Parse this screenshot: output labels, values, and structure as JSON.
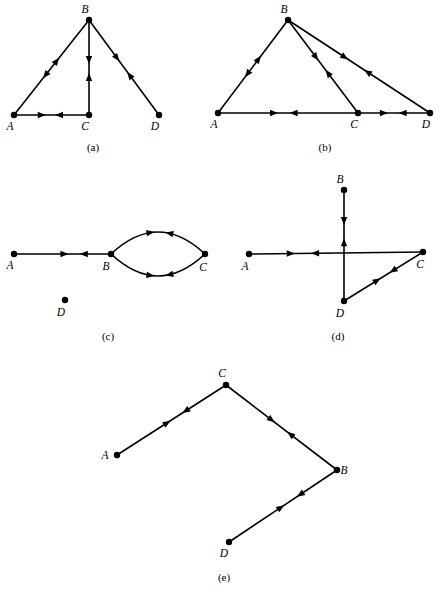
{
  "figure": {
    "width": 443,
    "height": 596,
    "background_color": "#ffffff",
    "ink_color": "#000000",
    "vertex_radius": 3.2,
    "edge_stroke_width": 1.6,
    "arrow_length": 8,
    "arrow_half_width": 3.2
  },
  "panels": [
    {
      "id": "a",
      "caption": "(a)",
      "caption_x": 93,
      "caption_y": 151,
      "vertices": [
        {
          "name": "A",
          "x": 14,
          "y": 115,
          "label": "A",
          "label_x": 10,
          "label_y": 130
        },
        {
          "name": "B",
          "x": 89,
          "y": 20,
          "label": "B",
          "label_x": 85,
          "label_y": 13
        },
        {
          "name": "C",
          "x": 89,
          "y": 115,
          "label": "C",
          "label_x": 85,
          "label_y": 130
        },
        {
          "name": "D",
          "x": 159,
          "y": 115,
          "label": "D",
          "label_x": 155,
          "label_y": 130
        }
      ],
      "edges": [
        {
          "from": "A",
          "to": "B",
          "name": "edge-a-b",
          "arrows": [
            {
              "t": 0.42,
              "dir": "backward"
            },
            {
              "t": 0.57,
              "dir": "forward"
            }
          ]
        },
        {
          "from": "B",
          "to": "C",
          "name": "edge-b-c",
          "arrows": [
            {
              "t": 0.42,
              "dir": "forward"
            },
            {
              "t": 0.6,
              "dir": "backward"
            }
          ]
        },
        {
          "from": "A",
          "to": "C",
          "name": "edge-a-c",
          "arrows": [
            {
              "t": 0.37,
              "dir": "forward"
            },
            {
              "t": 0.6,
              "dir": "backward"
            }
          ]
        },
        {
          "from": "B",
          "to": "D",
          "name": "edge-b-d",
          "arrows": [
            {
              "t": 0.4,
              "dir": "forward"
            },
            {
              "t": 0.58,
              "dir": "backward"
            }
          ]
        }
      ]
    },
    {
      "id": "b",
      "caption": "(b)",
      "caption_x": 325,
      "caption_y": 151,
      "vertices": [
        {
          "name": "A",
          "x": 218,
          "y": 113,
          "label": "A",
          "label_x": 214,
          "label_y": 128
        },
        {
          "name": "B",
          "x": 288,
          "y": 20,
          "label": "B",
          "label_x": 284,
          "label_y": 13
        },
        {
          "name": "C",
          "x": 358,
          "y": 113,
          "label": "C",
          "label_x": 354,
          "label_y": 128
        },
        {
          "name": "D",
          "x": 430,
          "y": 113,
          "label": "D",
          "label_x": 426,
          "label_y": 128
        }
      ],
      "edges": [
        {
          "from": "A",
          "to": "B",
          "name": "edge-a-b",
          "arrows": [
            {
              "t": 0.42,
              "dir": "backward"
            },
            {
              "t": 0.58,
              "dir": "forward"
            }
          ]
        },
        {
          "from": "B",
          "to": "C",
          "name": "edge-b-c",
          "arrows": [
            {
              "t": 0.4,
              "dir": "forward"
            },
            {
              "t": 0.57,
              "dir": "backward"
            }
          ]
        },
        {
          "from": "B",
          "to": "D",
          "name": "edge-b-d",
          "arrows": [
            {
              "t": 0.4,
              "dir": "forward"
            },
            {
              "t": 0.56,
              "dir": "backward"
            }
          ]
        },
        {
          "from": "A",
          "to": "C",
          "name": "edge-a-c",
          "arrows": [
            {
              "t": 0.4,
              "dir": "forward"
            },
            {
              "t": 0.54,
              "dir": "backward"
            }
          ]
        },
        {
          "from": "C",
          "to": "D",
          "name": "edge-c-d",
          "arrows": [
            {
              "t": 0.36,
              "dir": "forward"
            },
            {
              "t": 0.62,
              "dir": "backward"
            }
          ]
        }
      ]
    },
    {
      "id": "c",
      "caption": "(c)",
      "caption_x": 108,
      "caption_y": 340,
      "vertices": [
        {
          "name": "A",
          "x": 14,
          "y": 254,
          "label": "A",
          "label_x": 10,
          "label_y": 269
        },
        {
          "name": "B",
          "x": 111,
          "y": 254,
          "label": "B",
          "label_x": 106,
          "label_y": 270
        },
        {
          "name": "C",
          "x": 205,
          "y": 254,
          "label": "C",
          "label_x": 203,
          "label_y": 271
        },
        {
          "name": "D",
          "x": 65,
          "y": 300,
          "label": "D",
          "label_x": 61,
          "label_y": 316
        }
      ],
      "edges": [
        {
          "from": "A",
          "to": "B",
          "name": "edge-a-b",
          "arrows": [
            {
              "t": 0.52,
              "dir": "forward"
            },
            {
              "t": 0.72,
              "dir": "backward"
            }
          ]
        }
      ],
      "curved_edges": [
        {
          "from": "B",
          "to": "C",
          "name": "edge-b-c-upper",
          "bow": -22,
          "arrows": [
            {
              "t": 0.42,
              "dir": "forward"
            },
            {
              "t": 0.62,
              "dir": "backward"
            }
          ]
        },
        {
          "from": "B",
          "to": "C",
          "name": "edge-b-c-lower",
          "bow": 22,
          "arrows": [
            {
              "t": 0.42,
              "dir": "forward"
            },
            {
              "t": 0.62,
              "dir": "backward"
            }
          ]
        }
      ],
      "isolated_vertices": [
        "D"
      ]
    },
    {
      "id": "d",
      "caption": "(d)",
      "caption_x": 338,
      "caption_y": 340,
      "vertices": [
        {
          "name": "A",
          "x": 249,
          "y": 254,
          "label": "A",
          "label_x": 245,
          "label_y": 270
        },
        {
          "name": "B",
          "x": 344,
          "y": 190,
          "label": "B",
          "label_x": 340,
          "label_y": 183
        },
        {
          "name": "C",
          "x": 423,
          "y": 252,
          "label": "C",
          "label_x": 420,
          "label_y": 268
        },
        {
          "name": "D",
          "x": 344,
          "y": 301,
          "label": "D",
          "label_x": 340,
          "label_y": 317
        }
      ],
      "edges": [
        {
          "from": "A",
          "to": "C",
          "name": "edge-a-c",
          "arrows": [
            {
              "t": 0.24,
              "dir": "forward"
            },
            {
              "t": 0.38,
              "dir": "backward"
            }
          ]
        },
        {
          "from": "B",
          "to": "D",
          "name": "edge-b-d",
          "arrows": [
            {
              "t": 0.28,
              "dir": "forward"
            },
            {
              "t": 0.47,
              "dir": "backward"
            }
          ]
        },
        {
          "from": "D",
          "to": "C",
          "name": "edge-d-c",
          "arrows": [
            {
              "t": 0.42,
              "dir": "forward"
            },
            {
              "t": 0.62,
              "dir": "backward"
            }
          ]
        }
      ]
    },
    {
      "id": "e",
      "caption": "(e)",
      "caption_x": 224,
      "caption_y": 581,
      "vertices": [
        {
          "name": "A",
          "x": 117,
          "y": 455,
          "label": "A",
          "label_x": 105,
          "label_y": 459
        },
        {
          "name": "B",
          "x": 337,
          "y": 470,
          "label": "B",
          "label_x": 344,
          "label_y": 474
        },
        {
          "name": "C",
          "x": 226,
          "y": 385,
          "label": "C",
          "label_x": 222,
          "label_y": 377
        },
        {
          "name": "D",
          "x": 229,
          "y": 542,
          "label": "D",
          "label_x": 224,
          "label_y": 557
        }
      ],
      "edges": [
        {
          "from": "A",
          "to": "C",
          "name": "edge-a-c",
          "arrows": [
            {
              "t": 0.46,
              "dir": "forward"
            },
            {
              "t": 0.63,
              "dir": "backward"
            }
          ]
        },
        {
          "from": "C",
          "to": "B",
          "name": "edge-c-b",
          "arrows": [
            {
              "t": 0.41,
              "dir": "forward"
            },
            {
              "t": 0.58,
              "dir": "backward"
            }
          ]
        },
        {
          "from": "D",
          "to": "B",
          "name": "edge-d-b",
          "arrows": [
            {
              "t": 0.48,
              "dir": "forward"
            },
            {
              "t": 0.66,
              "dir": "backward"
            }
          ]
        }
      ]
    }
  ]
}
